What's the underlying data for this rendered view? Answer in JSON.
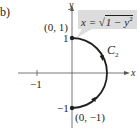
{
  "figure": {
    "part_label": "b)",
    "axes": {
      "x_label": "x",
      "y_label": "y",
      "x_ticks": [
        {
          "value": -1,
          "label": "−1"
        }
      ],
      "y_ticks": [
        {
          "value": 1,
          "label": "1"
        },
        {
          "value": -1,
          "label": "−1"
        }
      ]
    },
    "curve": {
      "name_main": "C",
      "name_sub": "2",
      "description": "right semicircle of unit circle from (0,-1) to (0,1), oriented counterclockwise"
    },
    "points": [
      {
        "label": "(0, 1)",
        "x": 0,
        "y": 1
      },
      {
        "label": "(0, −1)",
        "x": 0,
        "y": -1
      }
    ],
    "callout": {
      "lhs": "x = ",
      "radical": "√",
      "radicand_main": "1 − y",
      "radicand_exp": "2"
    },
    "colors": {
      "ink": "#231f20",
      "callout_bg": "#dcdcdc",
      "axis": "#555555"
    }
  }
}
